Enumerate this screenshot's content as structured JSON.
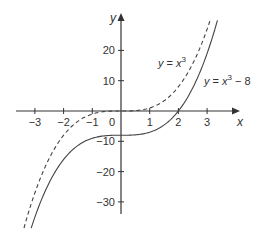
{
  "chart_data": {
    "type": "line",
    "title": "",
    "xlabel": "x",
    "ylabel": "y",
    "xlim": [
      -3.4,
      3.4
    ],
    "ylim": [
      -40,
      31
    ],
    "grid": false,
    "x_ticks": [
      -3,
      -2,
      -1,
      1,
      2,
      3
    ],
    "x_tick_labels": [
      "−3",
      "−2",
      "−1",
      "1",
      "2",
      "3"
    ],
    "y_ticks": [
      20,
      10,
      -10,
      -20,
      -30
    ],
    "y_tick_labels": [
      "20",
      "10",
      "−10",
      "−20",
      "−30"
    ],
    "origin_label": "0",
    "series": [
      {
        "name": "y = x^3",
        "label_text": "y = x",
        "label_exp": "3",
        "label_suffix": "",
        "style": "dashed",
        "function": "x^3",
        "x": [
          -3.38,
          -3,
          -2.5,
          -2,
          -1.5,
          -1,
          -0.5,
          0,
          0.5,
          1,
          1.5,
          2,
          2.5,
          3,
          3.1
        ],
        "values": [
          -38.6,
          -27,
          -15.6,
          -8,
          -3.4,
          -1,
          -0.1,
          0,
          0.1,
          1,
          3.4,
          8,
          15.6,
          27,
          29.8
        ]
      },
      {
        "name": "y = x^3 - 8",
        "label_text": "y = x",
        "label_exp": "3",
        "label_suffix": " − 8",
        "style": "solid",
        "function": "x^3 - 8",
        "x": [
          -3.13,
          -3,
          -2.5,
          -2,
          -1.5,
          -1,
          -0.5,
          0,
          0.5,
          1,
          1.5,
          2,
          2.5,
          3,
          3.36
        ],
        "values": [
          -38.7,
          -35,
          -23.6,
          -16,
          -11.4,
          -9,
          -8.1,
          -8,
          -7.9,
          -7,
          -4.6,
          0,
          7.6,
          19,
          29.9
        ]
      }
    ],
    "colors": {
      "axis": "#333333",
      "curve": "#444444"
    }
  }
}
